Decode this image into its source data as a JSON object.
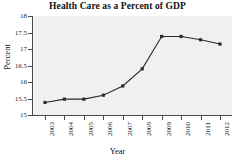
{
  "chart_data": {
    "type": "line",
    "title": "Health Care as a Percent of GDP",
    "xlabel": "Year",
    "ylabel": "Percent",
    "categories": [
      "2003",
      "2004",
      "2005",
      "2006",
      "2007",
      "2008",
      "2009",
      "2010",
      "2011",
      "2012"
    ],
    "values": [
      15.38,
      15.48,
      15.48,
      15.6,
      15.88,
      16.4,
      17.38,
      17.38,
      17.28,
      17.15
    ],
    "ylim": [
      15,
      18
    ],
    "yticks": [
      "15",
      "15.5",
      "16",
      "16.5",
      "17",
      "17.5",
      "18"
    ],
    "ytick_values": [
      15,
      15.5,
      16,
      16.5,
      17,
      17.5,
      18
    ],
    "grid": false,
    "legend": "none",
    "series_color": "#2b2b2b",
    "marker": "square",
    "plot_background": "#f0f0f0",
    "axis_color": "#4a4a4a",
    "xtick_rotation": 90
  }
}
